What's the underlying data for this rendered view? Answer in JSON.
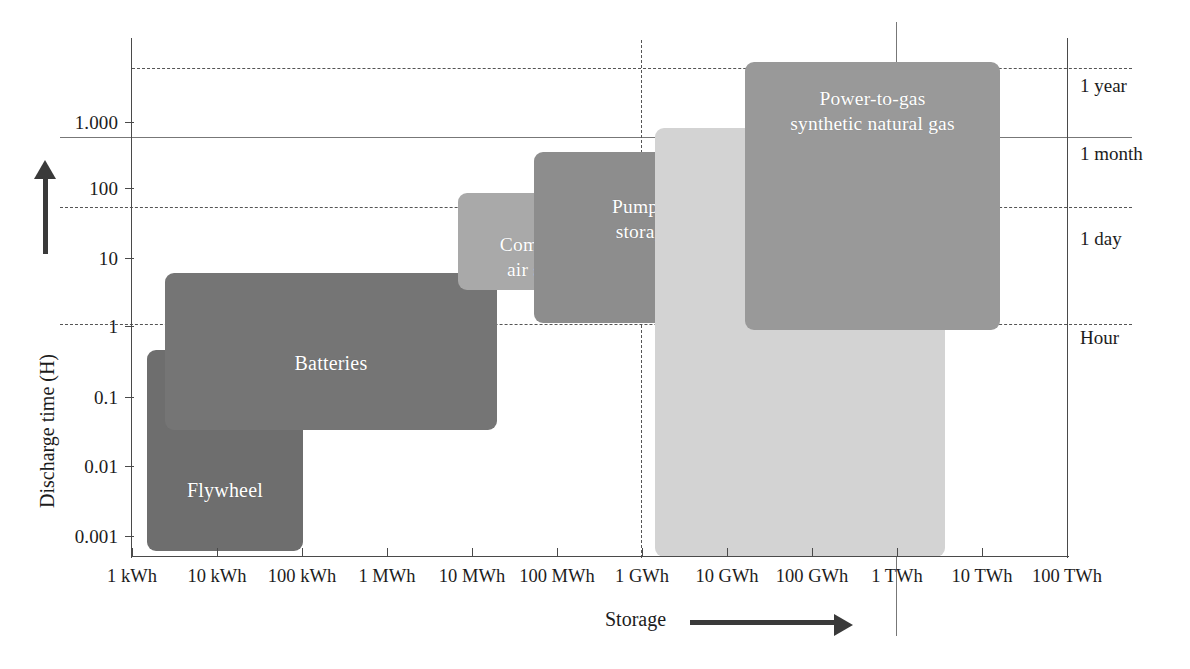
{
  "chart_data": {
    "type": "bar",
    "title": "",
    "xlabel": "Storage",
    "ylabel": "Discharge time (H)",
    "x_axis": {
      "scale": "log",
      "unit": "energy",
      "tick_labels": [
        "1 kWh",
        "10 kWh",
        "100 kWh",
        "1 MWh",
        "10 MWh",
        "100 MWh",
        "1 GWh",
        "10 GWh",
        "100 GWh",
        "1 TWh",
        "10 TWh",
        "100 TWh"
      ],
      "tick_values_kwh": [
        1,
        10,
        100,
        1000,
        10000,
        100000,
        1000000,
        10000000,
        100000000,
        1000000000,
        10000000000,
        100000000000
      ]
    },
    "y_axis": {
      "scale": "log",
      "unit": "hours",
      "tick_labels": [
        "1.000",
        "100",
        "10",
        "1",
        "0.1",
        "0.01",
        "0.001"
      ],
      "tick_values": [
        1000,
        100,
        10,
        1,
        0.1,
        0.01,
        0.001
      ],
      "ylim": [
        0.0005,
        3000
      ]
    },
    "reference_lines": [
      {
        "label": "1 year",
        "value_hours": 8760,
        "style": "dashed",
        "orientation": "horizontal"
      },
      {
        "label": "1 month",
        "value_hours": 730,
        "style": "solid",
        "orientation": "horizontal"
      },
      {
        "label": "1 day",
        "value_hours": 24,
        "style": "dashed",
        "orientation": "horizontal"
      },
      {
        "label": "Hour",
        "value_hours": 1,
        "style": "dashed",
        "orientation": "horizontal"
      },
      {
        "label": "1 GWh",
        "style": "dashed",
        "orientation": "vertical"
      },
      {
        "label": "1 TWh",
        "style": "solid",
        "orientation": "vertical"
      }
    ],
    "legend_position": "none",
    "grid": true,
    "regions": [
      {
        "name": "Flywheel",
        "label": "Flywheel",
        "color": "#6f6f6f",
        "storage_range": [
          "5 kWh",
          "100 kWh"
        ],
        "discharge_range_hours": [
          0.0007,
          0.5
        ]
      },
      {
        "name": "Batteries",
        "label": "Batteries",
        "color": "#767676",
        "storage_range": [
          "20 kWh",
          "20 MWh"
        ],
        "discharge_range_hours": [
          0.04,
          5
        ]
      },
      {
        "name": "Compressed air storage",
        "label": "Compressed\nair storage",
        "color": "#a8a8a8",
        "storage_range": [
          "10 MWh",
          "1 GWh"
        ],
        "discharge_range_hours": [
          0.35,
          60
        ]
      },
      {
        "name": "Pumped storage",
        "label": "Pumped\nstorage",
        "color": "#8e8e8e",
        "storage_range": [
          "80 MWh",
          "20 GWh"
        ],
        "discharge_range_hours": [
          16,
          300
        ]
      },
      {
        "name": "Power-to-gas hydrogen",
        "label": "Power-to-gas\nhydrogen",
        "color": "#d2d2d2",
        "storage_range": [
          "3 GWh",
          "3 TWh"
        ],
        "discharge_range_hours": [
          1,
          500
        ]
      },
      {
        "name": "Power-to-gas synthetic natural gas",
        "label": "Power-to-gas\nsynthetic natural gas",
        "color": "#9a9a9a",
        "storage_range": [
          "25 GWh",
          "20 TWh"
        ],
        "discharge_range_hours": [
          1.8,
          6000
        ]
      }
    ]
  },
  "axis_titles": {
    "y": "Discharge time (H)",
    "x": "Storage"
  },
  "y_ticks": [
    {
      "label": "1.000",
      "top": 112
    },
    {
      "label": "100",
      "top": 178
    },
    {
      "label": "10",
      "top": 248
    },
    {
      "label": "1",
      "top": 316
    },
    {
      "label": "0.1",
      "top": 387
    },
    {
      "label": "0.01",
      "top": 456
    },
    {
      "label": "0.001",
      "top": 526
    }
  ],
  "x_ticks": [
    {
      "label": "1 kWh",
      "center": 132
    },
    {
      "label": "10 kWh",
      "center": 217
    },
    {
      "label": "100 kWh",
      "center": 302
    },
    {
      "label": "1 MWh",
      "center": 387
    },
    {
      "label": "10 MWh",
      "center": 472
    },
    {
      "label": "100 MWh",
      "center": 557
    },
    {
      "label": "1 GWh",
      "center": 642
    },
    {
      "label": "10 GWh",
      "center": 727
    },
    {
      "label": "100 GWh",
      "center": 812
    },
    {
      "label": "1 TWh",
      "center": 897
    },
    {
      "label": "10 TWh",
      "center": 982
    },
    {
      "label": "100 TWh",
      "center": 1067
    }
  ],
  "time_labels": [
    {
      "label": "1 year",
      "top": 75
    },
    {
      "label": "1 month",
      "top": 143
    },
    {
      "label": "1 day",
      "top": 228
    },
    {
      "label": "Hour",
      "top": 327
    }
  ],
  "boxes": [
    {
      "name": "flywheel",
      "label": "Flywheel",
      "left": 147,
      "top": 350,
      "width": 156,
      "height": 201,
      "color": "#6e6e6e",
      "font": 20,
      "align": "center",
      "pad_top": 0
    },
    {
      "name": "batteries",
      "label": "Batteries",
      "left": 165,
      "top": 273,
      "width": 332,
      "height": 157,
      "color": "#757575",
      "font": 20,
      "align": "center",
      "pad_top": 0
    },
    {
      "name": "compressed-air-storage",
      "label": "Compressed\nair storage",
      "left": 458,
      "top": 193,
      "width": 182,
      "height": 97,
      "color": "#a9a9a9",
      "font": 19.5,
      "align": "center",
      "pad_top": 0
    },
    {
      "name": "pumped-storage",
      "label": "Pumped\nstorage",
      "left": 534,
      "top": 152,
      "width": 221,
      "height": 171,
      "color": "#8d8d8d",
      "font": 19.5,
      "align": "center",
      "pad_top": 0
    },
    {
      "name": "power-to-gas-hydrogen",
      "label": "Power-to-gas\nhydrogen",
      "left": 655,
      "top": 128,
      "width": 290,
      "height": 429,
      "color": "#d3d3d3",
      "font": 19.5,
      "align": "center",
      "pad_top": 0
    },
    {
      "name": "power-to-gas-synthetic-natural-gas",
      "label": "Power-to-gas\nsynthetic natural gas",
      "left": 745,
      "top": 62,
      "width": 255,
      "height": 268,
      "color": "#999999",
      "font": 19.5,
      "align": "center",
      "pad_top": 0
    }
  ],
  "geometry": {
    "axis_x": 132,
    "axis_y": 557,
    "plot_right": 1068,
    "plot_top": 38
  }
}
